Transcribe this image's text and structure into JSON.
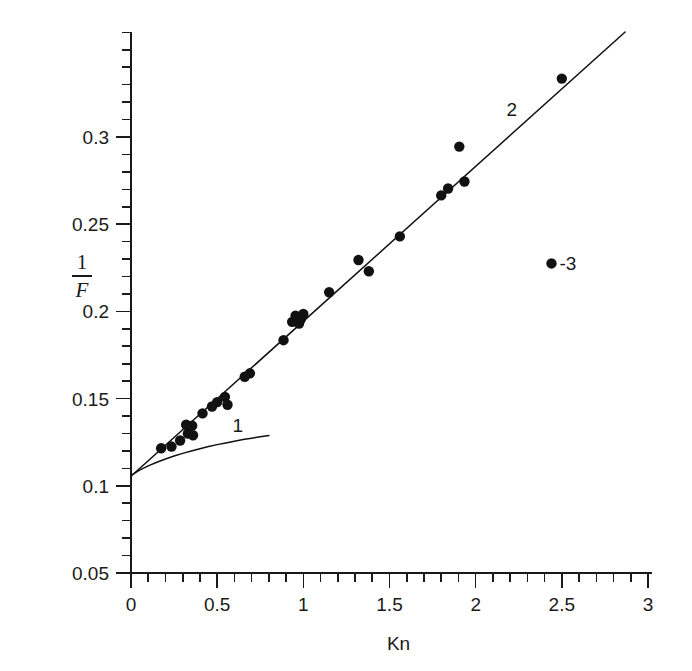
{
  "chart_data": {
    "type": "scatter",
    "title": "",
    "xlabel": "Kn",
    "ylabel": "1/F",
    "ylabel_numerator": "1",
    "ylabel_denominator": "F",
    "xlim": [
      0,
      3
    ],
    "ylim": [
      0.05,
      0.36
    ],
    "x_ticks": [
      0,
      0.5,
      1,
      1.5,
      2,
      2.5,
      3
    ],
    "x_ticklabels": [
      "0",
      "0.5",
      "1",
      "1.5",
      "2",
      "2.5",
      "3"
    ],
    "x_minor_step": 0.1,
    "y_ticks": [
      0.05,
      0.1,
      0.15,
      0.2,
      0.25,
      0.3
    ],
    "y_ticklabels": [
      "0.05",
      "0.1",
      "0.15",
      "0.2",
      "0.25",
      "0.3"
    ],
    "y_minor_step": 0.01,
    "grid": false,
    "legend_position": "inline-annotations",
    "annotations": [
      {
        "id": "curve-1-label",
        "text": "1",
        "x": 0.62,
        "y": 0.131,
        "meaning": "label for lower theoretical curve"
      },
      {
        "id": "line-2-label",
        "text": "2",
        "x": 2.21,
        "y": 0.312,
        "meaning": "label for straight fitted line"
      },
      {
        "id": "marker-3-label",
        "text": "-3",
        "x": 2.44,
        "y": 0.2275,
        "meaning": "label for experimental data points marker"
      }
    ],
    "series": [
      {
        "name": "3",
        "type": "scatter",
        "marker": "filled-circle",
        "color": "#111111",
        "points": [
          [
            0.175,
            0.1215
          ],
          [
            0.235,
            0.1225
          ],
          [
            0.285,
            0.126
          ],
          [
            0.32,
            0.135
          ],
          [
            0.33,
            0.13
          ],
          [
            0.355,
            0.1345
          ],
          [
            0.36,
            0.129
          ],
          [
            0.415,
            0.1415
          ],
          [
            0.47,
            0.1455
          ],
          [
            0.5,
            0.148
          ],
          [
            0.545,
            0.151
          ],
          [
            0.56,
            0.1465
          ],
          [
            0.66,
            0.1625
          ],
          [
            0.69,
            0.1645
          ],
          [
            0.885,
            0.1835
          ],
          [
            0.935,
            0.194
          ],
          [
            0.955,
            0.1975
          ],
          [
            0.975,
            0.193
          ],
          [
            0.985,
            0.1955
          ],
          [
            1.0,
            0.1985
          ],
          [
            1.15,
            0.211
          ],
          [
            1.32,
            0.2295
          ],
          [
            1.38,
            0.223
          ],
          [
            1.56,
            0.243
          ],
          [
            1.8,
            0.2665
          ],
          [
            1.84,
            0.2705
          ],
          [
            1.905,
            0.2945
          ],
          [
            1.935,
            0.2745
          ],
          [
            2.5,
            0.3335
          ]
        ]
      },
      {
        "name": "2",
        "type": "line",
        "style": "straight-fit",
        "color": "#111111",
        "x": [
          0.0,
          3.0
        ],
        "y": [
          0.1055,
          0.372
        ]
      },
      {
        "name": "1",
        "type": "line",
        "style": "theoretical-curve",
        "color": "#111111",
        "x": [
          0.0,
          0.05,
          0.1,
          0.15,
          0.2,
          0.25,
          0.3,
          0.35,
          0.4,
          0.45,
          0.5,
          0.55,
          0.6,
          0.65,
          0.7,
          0.75,
          0.8
        ],
        "y": [
          0.106,
          0.109,
          0.1114,
          0.1135,
          0.1154,
          0.1171,
          0.1186,
          0.12,
          0.1213,
          0.1225,
          0.1236,
          0.1246,
          0.1256,
          0.1265,
          0.1273,
          0.1281,
          0.1288
        ]
      }
    ]
  },
  "figure": {
    "background": "#ffffff",
    "axis_color": "#1a1a1a",
    "marker_color": "#111111",
    "marker_radius_px": 5.2
  }
}
